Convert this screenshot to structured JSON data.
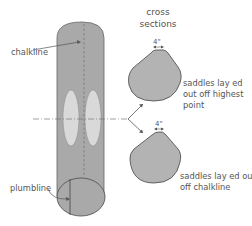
{
  "diagram": {
    "log_labels": {
      "chalkline": "chalkline",
      "plumbline": "plumbline"
    },
    "cross_sections": {
      "title_line1": "cross",
      "title_line2": "sections",
      "top": {
        "dimension": "4\"",
        "caption_line1": "saddles lay ed",
        "caption_line2": "out off highest",
        "caption_line3": "point"
      },
      "bottom": {
        "dimension": "4\"",
        "caption_line1": "saddles lay ed out",
        "caption_line2": "off chalkline"
      }
    },
    "colors": {
      "log_fill": "#a9a9a9",
      "saddle_fill": "#d9d9d9",
      "section_fill": "#b3b3b3",
      "outline": "#555555",
      "text": "#555555"
    }
  }
}
